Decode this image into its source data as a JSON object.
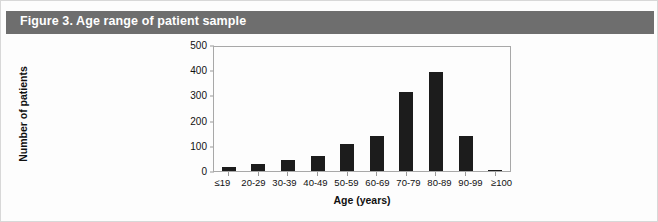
{
  "figure": {
    "caption": "Figure 3. Age range of patient sample",
    "caption_bar_color": "#6e6e6e",
    "caption_text_color": "#ffffff",
    "background_color": "#fdfdfd",
    "border_color": "#d8d8d8"
  },
  "chart_data": {
    "type": "bar",
    "title": "",
    "xlabel": "Age (years)",
    "ylabel": "Number of patients",
    "categories": [
      "≤19",
      "20-29",
      "30-39",
      "40-49",
      "50-59",
      "60-69",
      "70-79",
      "80-89",
      "90-99",
      "≥100"
    ],
    "values": [
      15,
      30,
      45,
      60,
      110,
      140,
      320,
      400,
      140,
      5
    ],
    "ylim": [
      0,
      500
    ],
    "yticks": [
      0,
      100,
      200,
      300,
      400,
      500
    ],
    "ytick_labels": [
      "0",
      "100",
      "200",
      "300",
      "400",
      "500"
    ],
    "grid": false,
    "legend": null,
    "bar_color": "#1c1c1c",
    "axis_color": "#a8a8a8"
  }
}
